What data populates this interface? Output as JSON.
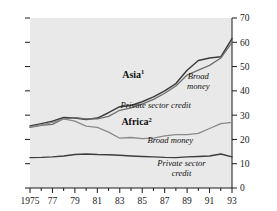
{
  "chart_data": {
    "type": "line",
    "title": "",
    "subtitle": "",
    "xlabel": "",
    "ylabel": "",
    "xlim": [
      1975,
      1993
    ],
    "ylim": [
      0,
      70
    ],
    "grid": false,
    "legend_position": "inline-annotations",
    "background_color": "#e9e9e9",
    "x": [
      1975,
      1976,
      1977,
      1978,
      1979,
      1980,
      1981,
      1982,
      1983,
      1984,
      1985,
      1986,
      1987,
      1988,
      1989,
      1990,
      1991,
      1992,
      1993
    ],
    "x_tick_labels": [
      "1975",
      "77",
      "79",
      "81",
      "83",
      "85",
      "87",
      "89",
      "91",
      "93"
    ],
    "x_tick_values": [
      1975,
      1977,
      1979,
      1981,
      1983,
      1985,
      1987,
      1989,
      1991,
      1993
    ],
    "y_tick_labels": [
      "0",
      "10",
      "20",
      "30",
      "40",
      "50",
      "60",
      "70"
    ],
    "y_tick_values": [
      0,
      10,
      20,
      30,
      40,
      50,
      60,
      70
    ],
    "series": [
      {
        "name": "Asia broad money",
        "group": "Asia",
        "label": "Broad money",
        "color": "#3d3d3d",
        "values": [
          25.5,
          26.5,
          27.5,
          29.0,
          28.8,
          28.2,
          28.8,
          31.0,
          33.5,
          34.0,
          35.5,
          37.5,
          40.0,
          43.0,
          48.5,
          52.5,
          53.5,
          54.0,
          61.5
        ]
      },
      {
        "name": "Asia private sector credit",
        "group": "Asia",
        "label": "Private sector credit",
        "color": "#6e6e6e",
        "values": [
          25.0,
          25.8,
          26.2,
          28.5,
          29.0,
          28.5,
          28.5,
          29.5,
          32.0,
          33.0,
          34.5,
          36.5,
          39.0,
          42.0,
          46.5,
          48.5,
          50.5,
          53.5,
          60.0
        ]
      },
      {
        "name": "Africa broad money",
        "group": "Africa",
        "label": "Broad money",
        "color": "#8a8a8a",
        "values": [
          25.2,
          26.0,
          27.0,
          28.5,
          27.5,
          25.5,
          25.0,
          23.0,
          20.5,
          20.8,
          20.3,
          20.5,
          21.5,
          22.0,
          22.0,
          22.5,
          24.5,
          26.5,
          27.0
        ]
      },
      {
        "name": "Africa private sector credit",
        "group": "Africa",
        "label": "Private sector credit",
        "color": "#3d3d3d",
        "values": [
          12.5,
          12.6,
          12.8,
          13.2,
          13.8,
          14.0,
          13.8,
          13.7,
          13.5,
          13.2,
          13.0,
          12.8,
          12.6,
          12.5,
          12.8,
          13.0,
          13.2,
          14.0,
          12.8
        ]
      }
    ],
    "annotations": [
      {
        "key": "asia",
        "text": "Asia",
        "superscript": "1",
        "x": 1984.2,
        "y": 45.5,
        "style": "bold"
      },
      {
        "key": "africa",
        "text": "Africa",
        "superscript": "2",
        "x": 1984.5,
        "y": 25.8,
        "style": "bold"
      },
      {
        "key": "asia_broad",
        "text_line1": "Broad",
        "text_line2": "money",
        "x": 1990.0,
        "y": 45.0,
        "style": "italic"
      },
      {
        "key": "asia_credit",
        "text_line1": "Private sector credit",
        "text_line2": "",
        "x": 1986.2,
        "y": 33.0,
        "style": "italic"
      },
      {
        "key": "africa_broad",
        "text_line1": "Broad money",
        "text_line2": "",
        "x": 1987.5,
        "y": 18.5,
        "style": "italic"
      },
      {
        "key": "africa_credit",
        "text_line1": "Private sector",
        "text_line2": "credit",
        "x": 1988.5,
        "y": 9.0,
        "style": "italic"
      }
    ]
  },
  "axes": {
    "y_right_ticks": [
      "70",
      "60",
      "50",
      "40",
      "30",
      "20",
      "10",
      "0"
    ],
    "x_ticks": [
      "1975",
      "77",
      "79",
      "81",
      "83",
      "85",
      "87",
      "89",
      "91",
      "93"
    ]
  }
}
